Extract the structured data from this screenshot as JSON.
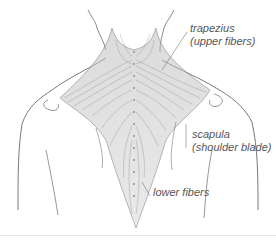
{
  "figure": {
    "labels": {
      "trapezius_line1": "trapezius",
      "trapezius_line2": "(upper fibers)",
      "scapula_line1": "scapula",
      "scapula_line2": "(shoulder blade)",
      "lower_fibers": "lower fibers"
    },
    "colors": {
      "outline": "#6a6a6a",
      "muscle_shade": "#9a9a9a",
      "label_text": "#555555",
      "leader_line": "#777777",
      "background": "#ffffff"
    }
  }
}
